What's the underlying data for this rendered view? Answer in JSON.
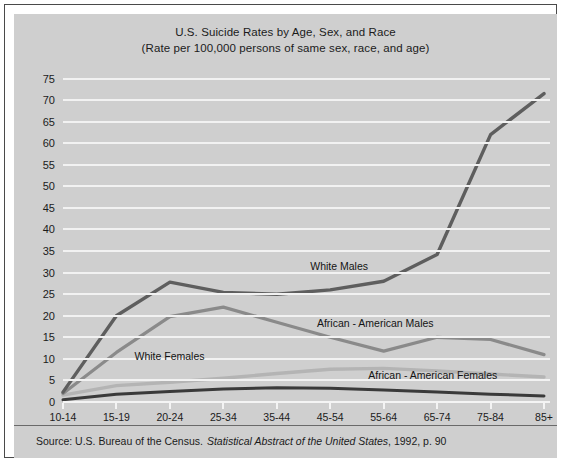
{
  "figure": {
    "title_line1": "U.S. Suicide Rates by Age, Sex, and Race",
    "title_line2": "(Rate per 100,000 persons of same sex, race, and age)",
    "source_prefix": "Source: U.S. Bureau of the Census.",
    "source_italic": "Statistical Abstract of the United States",
    "source_suffix": ", 1992, p. 90",
    "background_color": "#cfcfcf",
    "gridline_color": "#f2f2f2",
    "border_color": "#4a4a4a"
  },
  "chart_data": {
    "type": "line",
    "title": "U.S. Suicide Rates by Age, Sex, and Race (Rate per 100,000 persons of same sex, race, and age)",
    "xlabel": "Ages",
    "ylabel": "",
    "ylim": [
      0,
      75
    ],
    "ytick_step": 5,
    "grid": true,
    "legend": "inline-labels",
    "categories": [
      "10-14",
      "15-19",
      "20-24",
      "25-34",
      "35-44",
      "45-54",
      "55-64",
      "65-74",
      "75-84",
      "85+"
    ],
    "yticks": [
      0,
      5,
      10,
      15,
      20,
      25,
      30,
      35,
      40,
      45,
      50,
      55,
      60,
      65,
      70,
      75
    ],
    "series": [
      {
        "name": "White Males",
        "color": "#5e5e5e",
        "values": [
          2.3,
          20.0,
          27.8,
          25.4,
          25.0,
          26.0,
          28.0,
          34.2,
          62.0,
          71.5
        ]
      },
      {
        "name": "African - American Males",
        "color": "#8a8a8a",
        "values": [
          2.0,
          11.5,
          19.8,
          22.0,
          18.5,
          15.0,
          11.8,
          15.0,
          14.5,
          11.0
        ]
      },
      {
        "name": "White Females",
        "color": "#b4b4b4",
        "values": [
          1.6,
          3.8,
          4.6,
          5.5,
          6.6,
          7.6,
          7.8,
          7.2,
          6.5,
          5.8
        ]
      },
      {
        "name": "African - American Females",
        "color": "#3a3a3a",
        "values": [
          0.5,
          1.8,
          2.4,
          3.0,
          3.3,
          3.2,
          2.8,
          2.3,
          1.8,
          1.4
        ]
      }
    ]
  },
  "labels": {
    "white_males": "White Males",
    "african_american_males": "African - American Males",
    "white_females": "White Females",
    "african_american_females": "African - American Females"
  }
}
